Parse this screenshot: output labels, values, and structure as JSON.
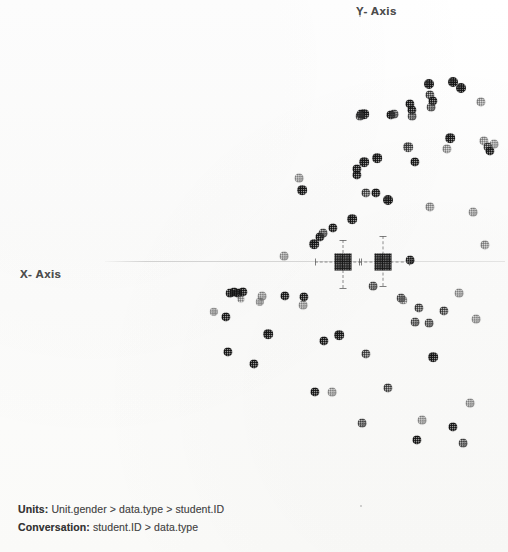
{
  "chart_data": {
    "type": "scatter",
    "title": "",
    "xlabel": "X- Axis",
    "ylabel": "Y- Axis",
    "grid": false,
    "legend": null,
    "axis_origin_note": "horizontal axis line drawn at y-centre; no tick labels printed",
    "notes": [
      "Units: Unit.gender > data.type > student.ID",
      "Conversation: student.ID > data.type"
    ],
    "centroids": [
      {
        "name": "centroid-left",
        "x": 343,
        "y": 262,
        "x_err_left": 28,
        "x_err_right": 18,
        "y_err_up": 22,
        "y_err_down": 26
      },
      {
        "name": "centroid-right",
        "x": 383,
        "y": 262,
        "x_err_left": 24,
        "x_err_right": 26,
        "y_err_up": 26,
        "y_err_down": 24
      }
    ],
    "points": [
      {
        "x": 429,
        "y": 84,
        "r": 5.0,
        "tone": "dark"
      },
      {
        "x": 453,
        "y": 82,
        "r": 5.0,
        "tone": "dark"
      },
      {
        "x": 461,
        "y": 88,
        "r": 5.0,
        "tone": "dark"
      },
      {
        "x": 430,
        "y": 95,
        "r": 4.6,
        "tone": "mid"
      },
      {
        "x": 433,
        "y": 101,
        "r": 4.6,
        "tone": "dark"
      },
      {
        "x": 431,
        "y": 107,
        "r": 4.4,
        "tone": "mid"
      },
      {
        "x": 410,
        "y": 104,
        "r": 4.6,
        "tone": "dark"
      },
      {
        "x": 412,
        "y": 110,
        "r": 4.6,
        "tone": "dark"
      },
      {
        "x": 412,
        "y": 116,
        "r": 4.4,
        "tone": "mid"
      },
      {
        "x": 481,
        "y": 102,
        "r": 4.6,
        "tone": "light"
      },
      {
        "x": 364,
        "y": 114,
        "r": 4.8,
        "tone": "dark"
      },
      {
        "x": 361,
        "y": 114,
        "r": 4.4,
        "tone": "dark"
      },
      {
        "x": 391,
        "y": 115,
        "r": 4.6,
        "tone": "dark"
      },
      {
        "x": 360,
        "y": 116,
        "r": 4.4,
        "tone": "mid"
      },
      {
        "x": 394,
        "y": 114,
        "r": 4.4,
        "tone": "mid"
      },
      {
        "x": 450,
        "y": 138,
        "r": 4.8,
        "tone": "dark"
      },
      {
        "x": 408,
        "y": 147,
        "r": 4.8,
        "tone": "mid"
      },
      {
        "x": 447,
        "y": 149,
        "r": 4.6,
        "tone": "light"
      },
      {
        "x": 484,
        "y": 141,
        "r": 4.6,
        "tone": "light"
      },
      {
        "x": 488,
        "y": 147,
        "r": 4.6,
        "tone": "mid"
      },
      {
        "x": 490,
        "y": 151,
        "r": 4.6,
        "tone": "dark"
      },
      {
        "x": 494,
        "y": 144,
        "r": 4.4,
        "tone": "light"
      },
      {
        "x": 364,
        "y": 162,
        "r": 4.8,
        "tone": "dark"
      },
      {
        "x": 377,
        "y": 158,
        "r": 4.8,
        "tone": "dark"
      },
      {
        "x": 357,
        "y": 169,
        "r": 4.6,
        "tone": "dark"
      },
      {
        "x": 357,
        "y": 175,
        "r": 4.6,
        "tone": "dark"
      },
      {
        "x": 415,
        "y": 162,
        "r": 4.6,
        "tone": "dark"
      },
      {
        "x": 299,
        "y": 178,
        "r": 4.4,
        "tone": "light"
      },
      {
        "x": 302,
        "y": 190,
        "r": 4.8,
        "tone": "dark"
      },
      {
        "x": 366,
        "y": 193,
        "r": 4.6,
        "tone": "mid"
      },
      {
        "x": 376,
        "y": 193,
        "r": 4.6,
        "tone": "dark"
      },
      {
        "x": 388,
        "y": 200,
        "r": 5.0,
        "tone": "dark"
      },
      {
        "x": 430,
        "y": 207,
        "r": 4.6,
        "tone": "light"
      },
      {
        "x": 473,
        "y": 212,
        "r": 4.4,
        "tone": "light"
      },
      {
        "x": 352,
        "y": 219,
        "r": 4.8,
        "tone": "dark"
      },
      {
        "x": 333,
        "y": 228,
        "r": 4.6,
        "tone": "dark"
      },
      {
        "x": 284,
        "y": 256,
        "r": 4.4,
        "tone": "light"
      },
      {
        "x": 320,
        "y": 237,
        "r": 4.6,
        "tone": "dark"
      },
      {
        "x": 323,
        "y": 233,
        "r": 4.4,
        "tone": "mid"
      },
      {
        "x": 314,
        "y": 244,
        "r": 4.8,
        "tone": "dark"
      },
      {
        "x": 485,
        "y": 245,
        "r": 4.6,
        "tone": "light"
      },
      {
        "x": 410,
        "y": 260,
        "r": 4.4,
        "tone": "dark"
      },
      {
        "x": 373,
        "y": 286,
        "r": 4.4,
        "tone": "mid"
      },
      {
        "x": 303,
        "y": 305,
        "r": 4.4,
        "tone": "light"
      },
      {
        "x": 262,
        "y": 296,
        "r": 4.4,
        "tone": "light"
      },
      {
        "x": 230,
        "y": 293,
        "r": 4.4,
        "tone": "dark"
      },
      {
        "x": 234,
        "y": 292,
        "r": 4.4,
        "tone": "dark"
      },
      {
        "x": 238,
        "y": 293,
        "r": 4.4,
        "tone": "dark"
      },
      {
        "x": 243,
        "y": 292,
        "r": 4.6,
        "tone": "dark"
      },
      {
        "x": 241,
        "y": 299,
        "r": 3.6,
        "tone": "light"
      },
      {
        "x": 260,
        "y": 302,
        "r": 4.2,
        "tone": "light"
      },
      {
        "x": 285,
        "y": 296,
        "r": 4.6,
        "tone": "dark"
      },
      {
        "x": 304,
        "y": 297,
        "r": 4.6,
        "tone": "dark"
      },
      {
        "x": 401,
        "y": 298,
        "r": 4.4,
        "tone": "mid"
      },
      {
        "x": 403,
        "y": 300,
        "r": 3.8,
        "tone": "light"
      },
      {
        "x": 459,
        "y": 293,
        "r": 4.4,
        "tone": "light"
      },
      {
        "x": 419,
        "y": 308,
        "r": 4.6,
        "tone": "mid"
      },
      {
        "x": 444,
        "y": 311,
        "r": 4.6,
        "tone": "mid"
      },
      {
        "x": 214,
        "y": 312,
        "r": 4.2,
        "tone": "light"
      },
      {
        "x": 226,
        "y": 317,
        "r": 4.6,
        "tone": "dark"
      },
      {
        "x": 476,
        "y": 319,
        "r": 4.4,
        "tone": "light"
      },
      {
        "x": 415,
        "y": 322,
        "r": 4.4,
        "tone": "mid"
      },
      {
        "x": 429,
        "y": 323,
        "r": 4.4,
        "tone": "mid"
      },
      {
        "x": 268,
        "y": 334,
        "r": 4.8,
        "tone": "dark"
      },
      {
        "x": 339,
        "y": 335,
        "r": 4.8,
        "tone": "dark"
      },
      {
        "x": 324,
        "y": 341,
        "r": 4.6,
        "tone": "dark"
      },
      {
        "x": 228,
        "y": 352,
        "r": 4.6,
        "tone": "dark"
      },
      {
        "x": 366,
        "y": 354,
        "r": 4.6,
        "tone": "mid"
      },
      {
        "x": 433,
        "y": 357,
        "r": 4.8,
        "tone": "dark"
      },
      {
        "x": 254,
        "y": 364,
        "r": 4.6,
        "tone": "dark"
      },
      {
        "x": 315,
        "y": 392,
        "r": 4.6,
        "tone": "dark"
      },
      {
        "x": 332,
        "y": 392,
        "r": 4.4,
        "tone": "light"
      },
      {
        "x": 388,
        "y": 388,
        "r": 4.6,
        "tone": "mid"
      },
      {
        "x": 470,
        "y": 403,
        "r": 4.4,
        "tone": "light"
      },
      {
        "x": 362,
        "y": 423,
        "r": 4.4,
        "tone": "mid"
      },
      {
        "x": 422,
        "y": 420,
        "r": 4.4,
        "tone": "light"
      },
      {
        "x": 453,
        "y": 427,
        "r": 4.6,
        "tone": "dark"
      },
      {
        "x": 417,
        "y": 440,
        "r": 4.6,
        "tone": "dark"
      },
      {
        "x": 463,
        "y": 443,
        "r": 4.4,
        "tone": "mid"
      }
    ]
  },
  "labels": {
    "y_axis": "Y- Axis",
    "x_axis": "X- Axis"
  },
  "footnotes": {
    "units_label": "Units:",
    "units_value": "Unit.gender > data.type > student.ID",
    "conversation_label": "Conversation:",
    "conversation_value": "student.ID > data.type"
  }
}
